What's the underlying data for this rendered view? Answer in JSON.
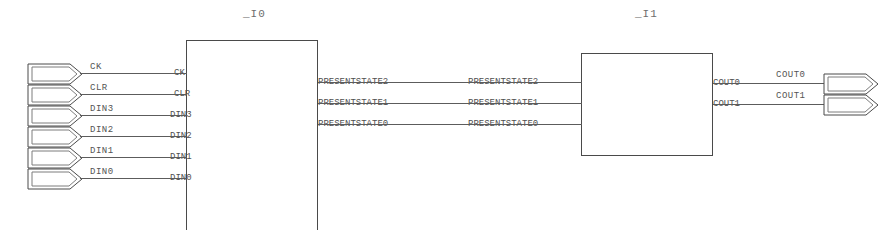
{
  "sheet": {
    "width": 894,
    "height": 230,
    "background": "#ffffff",
    "line_color": "#4a4a4a",
    "text_color": "#545454"
  },
  "blocks": [
    {
      "id": "block-i0",
      "title": "_I0",
      "x": 186,
      "y": 40,
      "w": 132,
      "h": 196,
      "title_x": 243,
      "title_y": 8,
      "input_pins": [
        "CK",
        "CLR",
        "DIN3",
        "DIN2",
        "DIN1",
        "DIN0"
      ],
      "output_pins": [
        "PRESENTSTATE2",
        "PRESENTSTATE1",
        "PRESENTSTATE0"
      ]
    },
    {
      "id": "block-i1",
      "title": "_I1",
      "x": 581,
      "y": 53,
      "w": 132,
      "h": 103,
      "title_x": 635,
      "title_y": 8,
      "input_pins": [
        "PRESENTSTATE2",
        "PRESENTSTATE1",
        "PRESENTSTATE0"
      ],
      "output_pins": [
        "COUT0",
        "COUT1"
      ]
    }
  ],
  "input_ports": [
    {
      "name": "CK",
      "net": "CK",
      "y": 73,
      "port_y": 63,
      "label_x": 90,
      "label_y": 63
    },
    {
      "name": "CLR",
      "net": "CLR",
      "y": 94,
      "port_y": 84,
      "label_x": 90,
      "label_y": 84
    },
    {
      "name": "DIN3",
      "net": "DIN3",
      "y": 115,
      "port_y": 105,
      "label_x": 90,
      "label_y": 105
    },
    {
      "name": "DIN2",
      "net": "DIN2",
      "y": 136,
      "port_y": 126,
      "label_x": 90,
      "label_y": 126
    },
    {
      "name": "DIN1",
      "net": "DIN1",
      "y": 157,
      "port_y": 147,
      "label_x": 90,
      "label_y": 147
    },
    {
      "name": "DIN0",
      "net": "DIN0",
      "y": 178,
      "port_y": 168,
      "label_x": 90,
      "label_y": 168
    }
  ],
  "output_ports": [
    {
      "name": "COUT0",
      "net": "COUT0",
      "y": 83,
      "port_y": 73,
      "label_x": 776,
      "label_y": 71
    },
    {
      "name": "COUT1",
      "net": "COUT1",
      "y": 104,
      "port_y": 94,
      "label_x": 776,
      "label_y": 92
    }
  ],
  "internal_nets": [
    {
      "name": "PRESENTSTATE2",
      "y": 82,
      "src_label_x": 318,
      "dst_label_x": 468
    },
    {
      "name": "PRESENTSTATE1",
      "y": 103,
      "src_label_x": 318,
      "dst_label_x": 468
    },
    {
      "name": "PRESENTSTATE0",
      "y": 124,
      "src_label_x": 318,
      "dst_label_x": 468
    }
  ],
  "port_shape": {
    "name": "pentagon-port",
    "width": 56,
    "height": 21
  }
}
